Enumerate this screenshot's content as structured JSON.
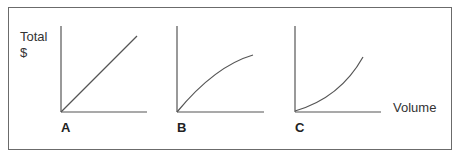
{
  "figure": {
    "y_axis_label_line1": "Total",
    "y_axis_label_line2": "$",
    "x_axis_label": "Volume",
    "panels": [
      {
        "label": "A",
        "shape": "linear"
      },
      {
        "label": "B",
        "shape": "concave (diminishing growth)"
      },
      {
        "label": "C",
        "shape": "convex (increasing growth)"
      }
    ],
    "colors": {
      "line": "#555555",
      "frame": "#6b6b6b",
      "text": "#333333"
    }
  }
}
